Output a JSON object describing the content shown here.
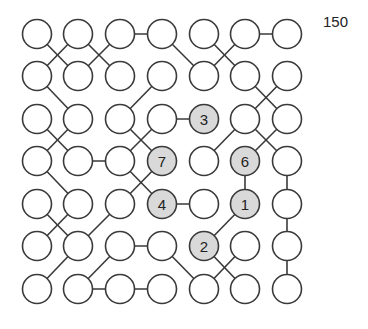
{
  "score": "150",
  "colors": {
    "stroke": "#3a3a3a",
    "empty_fill": "#ffffff",
    "numbered_fill": "#d9d9d9",
    "text": "#222222"
  },
  "grid": {
    "rows": 7,
    "cols": 7,
    "col_x": [
      37,
      78,
      120,
      162,
      204,
      245,
      287
    ],
    "row_y": [
      34,
      76,
      119,
      161,
      204,
      246,
      289
    ],
    "radius": 14.5
  },
  "numbered_cells": [
    {
      "row": 2,
      "col": 4,
      "label": "3"
    },
    {
      "row": 3,
      "col": 3,
      "label": "7"
    },
    {
      "row": 3,
      "col": 5,
      "label": "6"
    },
    {
      "row": 4,
      "col": 3,
      "label": "4"
    },
    {
      "row": 4,
      "col": 5,
      "label": "1"
    },
    {
      "row": 5,
      "col": 4,
      "label": "2"
    }
  ],
  "edges": [
    [
      [
        0,
        2
      ],
      [
        0,
        3
      ]
    ],
    [
      [
        0,
        5
      ],
      [
        0,
        6
      ]
    ],
    [
      [
        0,
        0
      ],
      [
        1,
        1
      ]
    ],
    [
      [
        0,
        1
      ],
      [
        1,
        0
      ]
    ],
    [
      [
        0,
        1
      ],
      [
        1,
        2
      ]
    ],
    [
      [
        0,
        2
      ],
      [
        1,
        1
      ]
    ],
    [
      [
        0,
        3
      ],
      [
        1,
        4
      ]
    ],
    [
      [
        0,
        4
      ],
      [
        1,
        5
      ]
    ],
    [
      [
        0,
        5
      ],
      [
        1,
        4
      ]
    ],
    [
      [
        1,
        0
      ],
      [
        2,
        1
      ]
    ],
    [
      [
        1,
        3
      ],
      [
        2,
        2
      ]
    ],
    [
      [
        1,
        5
      ],
      [
        2,
        6
      ]
    ],
    [
      [
        1,
        6
      ],
      [
        2,
        5
      ]
    ],
    [
      [
        2,
        3
      ],
      [
        2,
        4
      ]
    ],
    [
      [
        2,
        0
      ],
      [
        3,
        1
      ]
    ],
    [
      [
        2,
        1
      ],
      [
        3,
        0
      ]
    ],
    [
      [
        2,
        2
      ],
      [
        3,
        3
      ]
    ],
    [
      [
        2,
        3
      ],
      [
        3,
        2
      ]
    ],
    [
      [
        2,
        5
      ],
      [
        3,
        4
      ]
    ],
    [
      [
        2,
        5
      ],
      [
        3,
        6
      ]
    ],
    [
      [
        2,
        6
      ],
      [
        3,
        5
      ]
    ],
    [
      [
        3,
        1
      ],
      [
        3,
        2
      ]
    ],
    [
      [
        3,
        0
      ],
      [
        4,
        1
      ]
    ],
    [
      [
        3,
        2
      ],
      [
        4,
        3
      ]
    ],
    [
      [
        3,
        3
      ],
      [
        4,
        2
      ]
    ],
    [
      [
        3,
        5
      ],
      [
        4,
        5
      ]
    ],
    [
      [
        3,
        6
      ],
      [
        4,
        6
      ]
    ],
    [
      [
        4,
        3
      ],
      [
        4,
        4
      ]
    ],
    [
      [
        4,
        0
      ],
      [
        5,
        1
      ]
    ],
    [
      [
        4,
        1
      ],
      [
        5,
        0
      ]
    ],
    [
      [
        4,
        2
      ],
      [
        5,
        1
      ]
    ],
    [
      [
        4,
        5
      ],
      [
        5,
        4
      ]
    ],
    [
      [
        4,
        6
      ],
      [
        5,
        6
      ]
    ],
    [
      [
        5,
        2
      ],
      [
        5,
        3
      ]
    ],
    [
      [
        5,
        1
      ],
      [
        6,
        0
      ]
    ],
    [
      [
        5,
        2
      ],
      [
        6,
        1
      ]
    ],
    [
      [
        5,
        3
      ],
      [
        6,
        4
      ]
    ],
    [
      [
        5,
        4
      ],
      [
        6,
        5
      ]
    ],
    [
      [
        5,
        5
      ],
      [
        6,
        4
      ]
    ],
    [
      [
        5,
        6
      ],
      [
        6,
        6
      ]
    ],
    [
      [
        6,
        1
      ],
      [
        6,
        2
      ]
    ],
    [
      [
        6,
        2
      ],
      [
        6,
        3
      ]
    ]
  ]
}
